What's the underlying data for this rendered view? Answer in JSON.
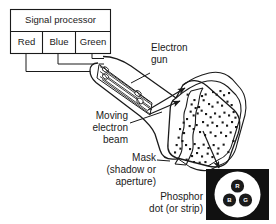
{
  "figure": {
    "line_color": "#1a1a1a",
    "fill_white": "#ffffff",
    "fill_black": "#111111"
  },
  "signal_processor": {
    "header_label": "Signal processor",
    "channels": [
      {
        "label": "Red"
      },
      {
        "label": "Blue"
      },
      {
        "label": "Green"
      }
    ]
  },
  "callouts": {
    "electron_gun": {
      "line1": "Electron",
      "line2": "gun"
    },
    "moving_beam": {
      "line1": "Moving",
      "line2": "electron",
      "line3": "beam"
    },
    "mask": {
      "line1": "Mask",
      "line2": "(shadow or",
      "line3": "aperture)"
    },
    "phosphor": {
      "line1": "Phosphor",
      "line2": "dot (or strip)"
    }
  },
  "phosphor_detail": {
    "dots": [
      {
        "letter": "R",
        "name": "red-phosphor-dot"
      },
      {
        "letter": "B",
        "name": "blue-phosphor-dot"
      },
      {
        "letter": "G",
        "name": "green-phosphor-dot"
      }
    ]
  }
}
